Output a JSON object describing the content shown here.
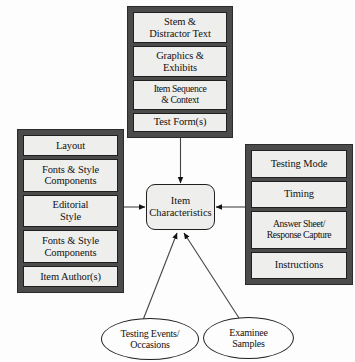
{
  "diagram": {
    "center": {
      "label": "Item\nCharacteristics",
      "line1": "Item",
      "line2": "Characteristics"
    },
    "groups": {
      "item_content": {
        "name": "item-content-group",
        "cells": [
          {
            "line1": "Stem &",
            "line2": "Distractor Text"
          },
          {
            "line1": "Graphics &",
            "line2": "Exhibits"
          },
          {
            "line1": "Item Sequence",
            "line2": "& Context"
          },
          {
            "line1": "Test Form(s)",
            "line2": ""
          }
        ]
      },
      "presentation": {
        "name": "presentation-group",
        "cells": [
          {
            "line1": "Layout",
            "line2": ""
          },
          {
            "line1": "Fonts & Style",
            "line2": "Components"
          },
          {
            "line1": "Editorial",
            "line2": "Style"
          },
          {
            "line1": "Fonts & Style",
            "line2": "Components"
          },
          {
            "line1": "Item Author(s)",
            "line2": ""
          }
        ]
      },
      "administration": {
        "name": "administration-group",
        "cells": [
          {
            "line1": "Testing Mode",
            "line2": ""
          },
          {
            "line1": "Timing",
            "line2": ""
          },
          {
            "line1": "Answer Sheet/",
            "line2": "Response Capture"
          },
          {
            "line1": "Instructions",
            "line2": ""
          }
        ]
      }
    },
    "ellipses": [
      {
        "name": "testing-events-occasions",
        "line1": "Testing Events/",
        "line2": "Occasions"
      },
      {
        "name": "examinee-samples",
        "line1": "Examinee",
        "line2": "Samples"
      }
    ],
    "colors": {
      "frame": "#4b4b4b",
      "cell_fill": "#eeeeec",
      "outline": "#1f1f1f",
      "background": "#fdfdfd"
    }
  }
}
